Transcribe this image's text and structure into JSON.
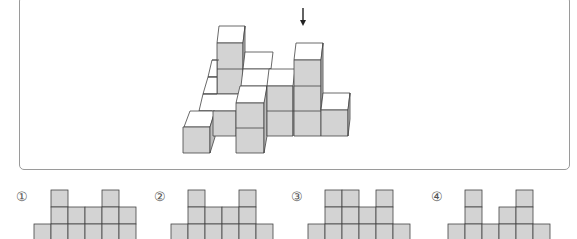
{
  "problem": {
    "view_arrow": {
      "direction": "down",
      "x": 303,
      "y1": 8,
      "y2": 26
    },
    "colors": {
      "front_face": "#d3d3d3",
      "top_face": "#ffffff",
      "side_face": "#bdbdbd",
      "edge": "#444444",
      "box_border": "#9a9a9a"
    },
    "figure_3d": {
      "description": "Isometric stack of unit cubes viewed from above; arrow indicates viewing direction",
      "faces": [
        {
          "type": "top",
          "pts": "219,26 245,26 243,43 217,43"
        },
        {
          "type": "front",
          "pts": "217,43 243,43 243,94 217,94"
        },
        {
          "type": "side",
          "pts": "243,43 245,26 245,77 243,94"
        },
        {
          "type": "top",
          "pts": "245,52 273,52 271,69 243,69"
        },
        {
          "type": "top",
          "pts": "243,69 271,69 269,86 241,86"
        },
        {
          "type": "top",
          "pts": "212,60 217,60 217,77 208,77"
        },
        {
          "type": "top",
          "pts": "208,77 217,77 217,94 203,94"
        },
        {
          "type": "top",
          "pts": "203,94 243,94 241,111 199,111"
        },
        {
          "type": "top",
          "pts": "199,111 212,111 210,127 185,127"
        },
        {
          "type": "top",
          "pts": "185,127 212,127 210,127 185,127"
        },
        {
          "type": "top",
          "pts": "190,111 215,111 210,127 184,127"
        },
        {
          "type": "front",
          "pts": "183,127 210,127 210,153 183,153"
        },
        {
          "type": "side",
          "pts": "210,127 215,111 215,137 210,153"
        },
        {
          "type": "front",
          "pts": "213,111 236,111 236,136 213,136"
        },
        {
          "type": "top",
          "pts": "240,86 267,86 265,103 236,103"
        },
        {
          "type": "front",
          "pts": "236,103 264,103 264,153 236,153"
        },
        {
          "type": "side",
          "pts": "264,103 267,86 267,136 264,153"
        },
        {
          "type": "top",
          "pts": "269,69 295,69 293,86 267,86"
        },
        {
          "type": "front",
          "pts": "267,86 293,86 293,136 267,136"
        },
        {
          "type": "top",
          "pts": "296,43 323,43 321,60 294,60"
        },
        {
          "type": "front",
          "pts": "294,60 321,60 321,136 294,136"
        },
        {
          "type": "side",
          "pts": "321,60 323,43 323,93 321,110"
        },
        {
          "type": "top",
          "pts": "323,93 350,93 348,110 321,110"
        },
        {
          "type": "front",
          "pts": "321,110 348,110 348,136 321,136"
        },
        {
          "type": "side",
          "pts": "348,110 350,93 350,119 348,136"
        }
      ],
      "lines": [
        {
          "pts": "217,69 243,69"
        },
        {
          "pts": "236,128 264,128"
        },
        {
          "pts": "267,111 321,111"
        },
        {
          "pts": "294,86 321,86"
        },
        {
          "pts": "293,86 293,136"
        },
        {
          "pts": "203,94 217,94"
        },
        {
          "pts": "208,77 217,77"
        },
        {
          "pts": "212,60 219,60"
        }
      ]
    },
    "options": [
      {
        "label": "①",
        "label_pos": {
          "x": 16,
          "y": 190
        },
        "origin_x": 34,
        "rows": [
          {
            "y": 190,
            "cols": [
              1,
              4
            ]
          },
          {
            "y": 207,
            "cols": [
              1,
              2,
              3,
              4,
              5
            ]
          },
          {
            "y": 224,
            "cols": [
              0,
              1,
              2,
              3,
              4,
              5
            ]
          }
        ]
      },
      {
        "label": "②",
        "label_pos": {
          "x": 154,
          "y": 190
        },
        "origin_x": 171,
        "rows": [
          {
            "y": 190,
            "cols": [
              1,
              4
            ]
          },
          {
            "y": 207,
            "cols": [
              1,
              2,
              3,
              4
            ]
          },
          {
            "y": 224,
            "cols": [
              0,
              1,
              2,
              3,
              4,
              5
            ]
          }
        ]
      },
      {
        "label": "③",
        "label_pos": {
          "x": 291,
          "y": 190
        },
        "origin_x": 308,
        "rows": [
          {
            "y": 190,
            "cols": [
              1,
              2,
              4
            ]
          },
          {
            "y": 207,
            "cols": [
              1,
              2,
              3,
              4
            ]
          },
          {
            "y": 224,
            "cols": [
              0,
              1,
              2,
              3,
              4,
              5
            ]
          }
        ]
      },
      {
        "label": "④",
        "label_pos": {
          "x": 431,
          "y": 190
        },
        "origin_x": 448,
        "rows": [
          {
            "y": 190,
            "cols": [
              1,
              4
            ]
          },
          {
            "y": 207,
            "cols": [
              1,
              3,
              4
            ]
          },
          {
            "y": 224,
            "cols": [
              0,
              1,
              2,
              3,
              4,
              5
            ]
          }
        ]
      }
    ],
    "cell_size": 17
  }
}
